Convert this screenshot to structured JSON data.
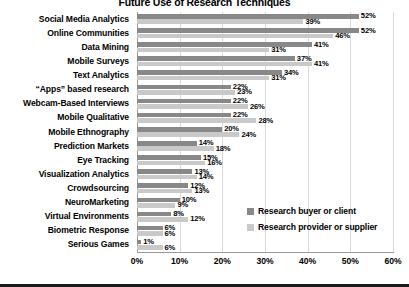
{
  "chart_data": {
    "type": "bar",
    "orientation": "horizontal",
    "title": "Future Use of Research Techniques",
    "xlabel": "",
    "ylabel": "",
    "xlim": [
      0,
      60
    ],
    "xticks": [
      "0%",
      "10%",
      "20%",
      "30%",
      "40%",
      "50%",
      "60%"
    ],
    "grid": true,
    "legend_position": "center-right",
    "categories": [
      "Social Media Analytics",
      "Online Communities",
      "Data Mining",
      "Mobile Surveys",
      "Text Analytics",
      "“Apps” based research",
      "Webcam-Based Interviews",
      "Mobile Qualitative",
      "Mobile Ethnography",
      "Prediction Markets",
      "Eye Tracking",
      "Visualization Analytics",
      "Crowdsourcing",
      "NeuroMarketing",
      "Virtual Environments",
      "Biometric Response",
      "Serious Games"
    ],
    "series": [
      {
        "name": "Research buyer or client",
        "color": "#888888",
        "values": [
          52,
          52,
          41,
          37,
          34,
          22,
          22,
          22,
          20,
          14,
          15,
          13,
          12,
          10,
          8,
          6,
          1
        ],
        "labels": [
          "52%",
          "52%",
          "41%",
          "37%",
          "34%",
          "22%",
          "22%",
          "22%",
          "20%",
          "14%",
          "15%",
          "13%",
          "12%",
          "10%",
          "8%",
          "6%",
          "1%"
        ]
      },
      {
        "name": "Research provider or supplier",
        "color": "#c9c9c9",
        "values": [
          39,
          46,
          31,
          41,
          31,
          23,
          26,
          28,
          24,
          18,
          16,
          14,
          13,
          9,
          12,
          6,
          6
        ],
        "labels": [
          "39%",
          "46%",
          "31%",
          "41%",
          "31%",
          "23%",
          "26%",
          "28%",
          "24%",
          "18%",
          "16%",
          "14%",
          "13%",
          "9%",
          "12%",
          "6%",
          "6%"
        ]
      }
    ]
  },
  "legend": {
    "items": [
      {
        "label": "Research buyer or client",
        "swatch": "buyer"
      },
      {
        "label": "Research provider or supplier",
        "swatch": "provider"
      }
    ]
  }
}
